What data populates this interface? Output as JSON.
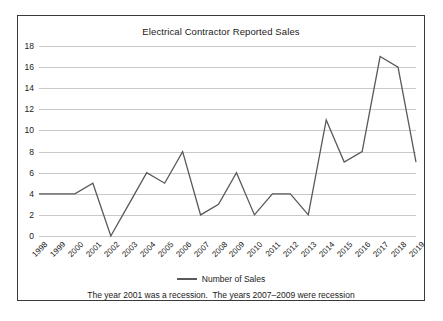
{
  "chart_data": {
    "type": "line",
    "title": "Electrical Contractor Reported Sales",
    "xlabel": "",
    "ylabel": "",
    "ylim": [
      0,
      18
    ],
    "ytick_step": 2,
    "grid": true,
    "legend_position": "bottom",
    "categories": [
      "1998",
      "1999",
      "2000",
      "2001",
      "2002",
      "2003",
      "2004",
      "2005",
      "2006",
      "2007",
      "2008",
      "2009",
      "2010",
      "2011",
      "2012",
      "2013",
      "2014",
      "2015",
      "2016",
      "2017",
      "2018",
      "2019"
    ],
    "yticks": [
      0,
      2,
      4,
      6,
      8,
      10,
      12,
      14,
      16,
      18
    ],
    "series": [
      {
        "name": "Number of  Sales",
        "color": "#595959",
        "values": [
          4,
          4,
          4,
          5,
          0,
          3,
          6,
          5,
          8,
          2,
          3,
          6,
          2,
          4,
          4,
          2,
          11,
          7,
          8,
          17,
          16,
          7
        ]
      }
    ],
    "annotations": [
      "The year 2001 was a recession.  The years 2007–2009 were recession"
    ]
  },
  "legend": {
    "label": "Number of  Sales"
  },
  "caption": {
    "text": "The year 2001 was a recession.  The years 2007–2009 were recession"
  },
  "colors": {
    "series_line": "#595959",
    "gridline": "#c9c9c9",
    "frame_border": "#3a3a3a",
    "text": "#1a1a1a",
    "background": "#ffffff"
  }
}
